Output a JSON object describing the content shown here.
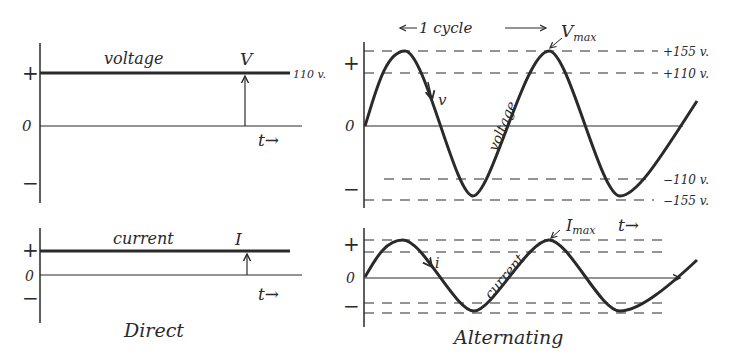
{
  "direct": {
    "caption": "Direct",
    "voltage": {
      "label": "voltage",
      "symbol": "V",
      "value_label": "110 v.",
      "plus": "+",
      "zero": "0",
      "minus": "−",
      "time": "t→"
    },
    "current": {
      "label": "current",
      "symbol": "I",
      "plus": "+",
      "zero": "0",
      "minus": "−",
      "time": "t→"
    }
  },
  "alternating": {
    "caption": "Alternating",
    "cycle_label": "1 cycle",
    "voltage": {
      "label": "voltage",
      "instant": "v",
      "max_label": "V",
      "max_sub": "max",
      "levels": [
        "+155 v.",
        "+110 v.",
        "−110 v.",
        "−155 v."
      ],
      "plus": "+",
      "zero": "0",
      "minus": "−"
    },
    "current": {
      "label": "current",
      "instant": "i",
      "max_label": "I",
      "max_sub": "max",
      "time": "t→",
      "plus": "+",
      "zero": "0",
      "minus": "−"
    }
  },
  "colors": {
    "ink": "#2a2a2a",
    "background": "#ffffff"
  }
}
